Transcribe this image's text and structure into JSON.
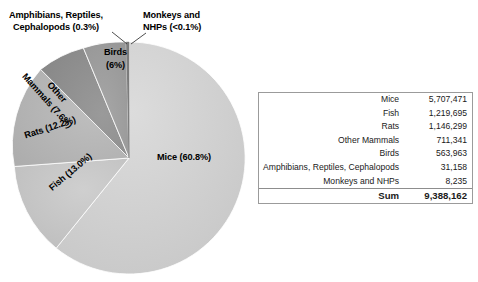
{
  "chart_data": {
    "type": "pie",
    "title": "",
    "categories": [
      "Mice",
      "Fish",
      "Rats",
      "Other Mammals",
      "Birds",
      "Amphibians, Reptiles, Cephalopods",
      "Monkeys and NHPs"
    ],
    "values": [
      5707471,
      1219695,
      1146299,
      711341,
      563963,
      31158,
      8235
    ],
    "percentages": [
      60.8,
      13.0,
      12.2,
      7.6,
      6.0,
      0.3,
      0.088
    ],
    "percent_labels": [
      "60.8%",
      "13.0%",
      "12.2%",
      "7.6%",
      "6%",
      "0.3%",
      "<0.1%"
    ],
    "slice_colors": [
      "#d0d0d0",
      "#c2c2c2",
      "#b3b3b3",
      "#8f8f8f",
      "#9e9e9e",
      "#7d7d7d",
      "#6e6e6e"
    ],
    "start_angle_deg": 0,
    "direction": "clockwise",
    "legend": "none",
    "grid": false,
    "sum": 9388162
  },
  "pie_labels": {
    "mice": "Mice (60.8%)",
    "fish": "Fish (13.0%)",
    "rats": "Rats (12.2%)",
    "birds_line1": "Birds",
    "birds_line2": "(6%)",
    "other_mammals_line1": "Other",
    "other_mammals_line2": "Mammals (7.6%)",
    "amphibians_line1": "Amphibians, Reptiles,",
    "amphibians_line2": "Cephalopods (0.3%)",
    "monkeys_line1": "Monkeys and",
    "monkeys_line2": "NHPs (<0.1%)"
  },
  "table": {
    "rows": [
      {
        "label": "Mice",
        "value": "5,707,471"
      },
      {
        "label": "Fish",
        "value": "1,219,695"
      },
      {
        "label": "Rats",
        "value": "1,146,299"
      },
      {
        "label": "Other Mammals",
        "value": "711,341"
      },
      {
        "label": "Birds",
        "value": "563,963"
      },
      {
        "label": "Amphibians, Reptiles, Cephalopods",
        "value": "31,158"
      },
      {
        "label": "Monkeys and NHPs",
        "value": "8,235"
      }
    ],
    "sum_label": "Sum",
    "sum_value": "9,388,162"
  }
}
